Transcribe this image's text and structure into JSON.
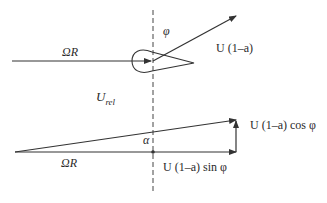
{
  "diagram": {
    "type": "velocity triangle at blade element",
    "colors": {
      "line": "#333333",
      "background": "#ffffff"
    },
    "labels": {
      "omega_r_top": "ΩR",
      "phi": "φ",
      "u_axial": "U (1–a)",
      "u_rel": "U",
      "u_rel_sub": "rel",
      "alpha": "α",
      "omega_r_bottom": "ΩR",
      "u_cos": "U (1–a) cos φ",
      "u_sin": "U (1–a) sin φ"
    }
  }
}
